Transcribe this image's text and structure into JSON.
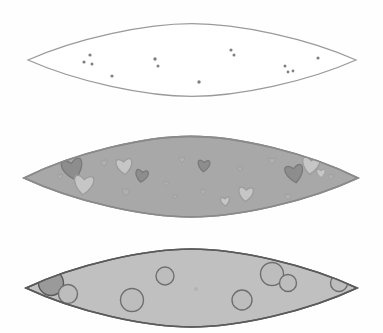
{
  "figure": {
    "title": "Three stacked lens-shaped cross-sections with inclusions",
    "canvas": {
      "width": 383,
      "height": 333,
      "background": "#fefefe"
    },
    "panel_count": 3
  },
  "palette": {
    "background": "#fefefe",
    "outline_light": "#9a9a9a",
    "outline_dark": "#4d4d4d",
    "outline_mid": "#6f6f6f",
    "fill_empty": "#ffffff",
    "fill_medium": "#a8a8a8",
    "fill_light": "#c0c0c0",
    "dot_color": "#808080",
    "heart_dark": "#8d8d8d",
    "heart_light": "#c6c6c6",
    "heart_mid": "#b0b0b0",
    "circle_dark": "#9a9a9a",
    "circle_light": "#bdbdbd"
  },
  "panels": [
    {
      "id": "panel-top",
      "name": "empty-lens",
      "fill": "#ffffff",
      "outline": "#9a9a9a",
      "outline_width": 1.3,
      "geometry": {
        "left": 28,
        "right": 356,
        "center_y": 60,
        "top": 32,
        "bottom": 88
      },
      "inclusion_type": "dot",
      "inclusion_count": 13,
      "inclusions": [
        {
          "cx": 90,
          "cy": 55,
          "r": 1.6
        },
        {
          "cx": 84,
          "cy": 62,
          "r": 1.6
        },
        {
          "cx": 92,
          "cy": 64,
          "r": 1.5
        },
        {
          "cx": 112,
          "cy": 76,
          "r": 1.6
        },
        {
          "cx": 155,
          "cy": 59,
          "r": 1.7
        },
        {
          "cx": 158,
          "cy": 66,
          "r": 1.5
        },
        {
          "cx": 199,
          "cy": 82,
          "r": 1.7
        },
        {
          "cx": 231,
          "cy": 50,
          "r": 1.6
        },
        {
          "cx": 234,
          "cy": 55,
          "r": 1.5
        },
        {
          "cx": 285,
          "cy": 66,
          "r": 1.5
        },
        {
          "cx": 288,
          "cy": 72,
          "r": 1.4
        },
        {
          "cx": 293,
          "cy": 71,
          "r": 1.4
        },
        {
          "cx": 318,
          "cy": 58,
          "r": 1.6
        }
      ]
    },
    {
      "id": "panel-middle",
      "name": "heart-inclusion-lens",
      "fill": "#a8a8a8",
      "outline": "#8a8a8a",
      "outline_width": 1.6,
      "geometry": {
        "left": 24,
        "right": 358,
        "center_y": 178,
        "top": 146,
        "bottom": 208
      },
      "inclusion_type": "heart",
      "inclusion_count": 21,
      "inclusions": [
        {
          "cx": 72,
          "cy": 166,
          "s": 15.0,
          "rot": -12,
          "tone": "dark"
        },
        {
          "cx": 84,
          "cy": 182,
          "s": 14.0,
          "rot": 6,
          "tone": "light"
        },
        {
          "cx": 104,
          "cy": 162,
          "s": 4.5,
          "rot": -8,
          "tone": "mid"
        },
        {
          "cx": 124,
          "cy": 164,
          "s": 11.5,
          "rot": -6,
          "tone": "light"
        },
        {
          "cx": 142,
          "cy": 174,
          "s": 9.0,
          "rot": 10,
          "tone": "dark"
        },
        {
          "cx": 126,
          "cy": 191,
          "s": 5.0,
          "rot": 0,
          "tone": "mid"
        },
        {
          "cx": 182,
          "cy": 159,
          "s": 4.0,
          "rot": -4,
          "tone": "mid"
        },
        {
          "cx": 204,
          "cy": 164,
          "s": 8.5,
          "rot": 4,
          "tone": "dark"
        },
        {
          "cx": 203,
          "cy": 191,
          "s": 4.0,
          "rot": 0,
          "tone": "mid"
        },
        {
          "cx": 225,
          "cy": 200,
          "s": 6.5,
          "rot": -6,
          "tone": "light"
        },
        {
          "cx": 246,
          "cy": 192,
          "s": 10.5,
          "rot": 5,
          "tone": "light"
        },
        {
          "cx": 272,
          "cy": 160,
          "s": 4.5,
          "rot": 0,
          "tone": "mid"
        },
        {
          "cx": 288,
          "cy": 196,
          "s": 4.5,
          "rot": 0,
          "tone": "mid"
        },
        {
          "cx": 294,
          "cy": 171,
          "s": 13.0,
          "rot": -10,
          "tone": "dark"
        },
        {
          "cx": 311,
          "cy": 163,
          "s": 12.5,
          "rot": 8,
          "tone": "light"
        },
        {
          "cx": 321,
          "cy": 172,
          "s": 6.0,
          "rot": 0,
          "tone": "light"
        },
        {
          "cx": 331,
          "cy": 176,
          "s": 4.0,
          "rot": 0,
          "tone": "mid"
        },
        {
          "cx": 166,
          "cy": 183,
          "s": 3.5,
          "rot": 0,
          "tone": "mid"
        },
        {
          "cx": 240,
          "cy": 168,
          "s": 3.5,
          "rot": 0,
          "tone": "mid"
        },
        {
          "cx": 60,
          "cy": 176,
          "s": 3.5,
          "rot": 0,
          "tone": "mid"
        },
        {
          "cx": 175,
          "cy": 196,
          "s": 3.2,
          "rot": 0,
          "tone": "mid"
        }
      ]
    },
    {
      "id": "panel-bottom",
      "name": "circle-inclusion-lens",
      "fill": "#c0c0c0",
      "outline": "#5a5a5a",
      "outline_width": 1.6,
      "geometry": {
        "left": 26,
        "right": 357,
        "center_y": 288,
        "top": 258,
        "bottom": 318
      },
      "inclusion_type": "circle",
      "inclusion_count": 9,
      "inclusions": [
        {
          "cx": 51,
          "cy": 283,
          "r": 12.5,
          "tone": "dark"
        },
        {
          "cx": 68,
          "cy": 294,
          "r": 9.5,
          "tone": "light"
        },
        {
          "cx": 132,
          "cy": 300,
          "r": 11.5,
          "tone": "light"
        },
        {
          "cx": 165,
          "cy": 276,
          "r": 9.0,
          "tone": "light"
        },
        {
          "cx": 242,
          "cy": 300,
          "r": 10.0,
          "tone": "light"
        },
        {
          "cx": 272,
          "cy": 274,
          "r": 11.5,
          "tone": "light"
        },
        {
          "cx": 288,
          "cy": 283,
          "r": 8.5,
          "tone": "light"
        },
        {
          "cx": 339,
          "cy": 283,
          "r": 8.5,
          "tone": "light"
        },
        {
          "cx": 196,
          "cy": 289,
          "r": 2.0,
          "tone": "speck"
        }
      ]
    }
  ]
}
